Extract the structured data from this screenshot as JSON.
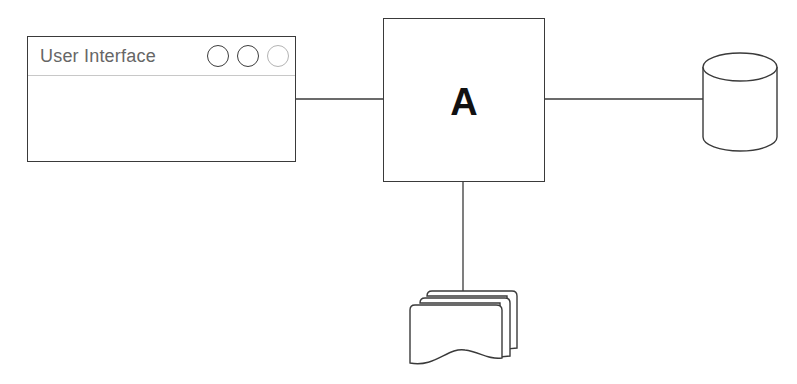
{
  "diagram": {
    "user_interface": {
      "title": "User Interface",
      "window_buttons": [
        "circle",
        "circle",
        "circle-faded"
      ]
    },
    "central_component": {
      "label": "A"
    },
    "database": {
      "icon": "database-cylinder-icon"
    },
    "documents": {
      "icon": "document-stack-icon"
    },
    "connections": [
      {
        "from": "User Interface",
        "to": "A"
      },
      {
        "from": "A",
        "to": "database"
      },
      {
        "from": "A",
        "to": "documents"
      }
    ],
    "colors": {
      "stroke": "#3a3a3a",
      "faded_stroke": "#b4b4b4",
      "title_text": "#666666",
      "label_text": "#111111"
    }
  }
}
